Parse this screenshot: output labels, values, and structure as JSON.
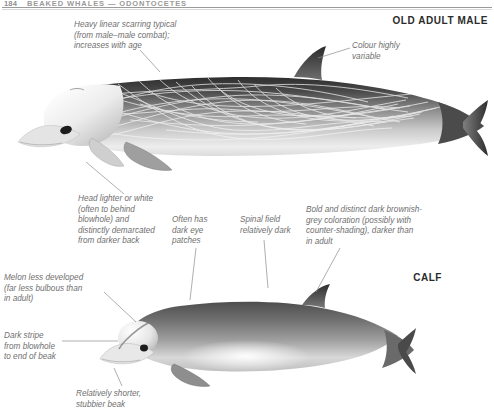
{
  "page": {
    "folio": "184",
    "running_head": "BEAKED WHALES — ODONTOCETES"
  },
  "sections": {
    "old_adult_male": "OLD ADULT MALE",
    "calf": "CALF"
  },
  "annotations": {
    "scarring": "Heavy linear scarring typical\n(from male–male combat);\nincreases with age",
    "colour_variable": "Colour highly\nvariable",
    "head_lighter": "Head lighter or white\n(often to behind\nblowhole) and\ndistinctly demarcated\nfrom darker back",
    "eye_patches": "Often has\ndark eye\npatches",
    "spinal_field": "Spinal field\nrelatively dark",
    "calf_coloration": "Bold and distinct dark brownish-\ngrey coloration (possibly with\ncounter-shading), darker than\nin adult",
    "melon": "Melon less developed\n(far less bulbous than\nin adult)",
    "dark_stripe": "Dark stripe\nfrom blowhole\nto end of beak",
    "stubbier_beak": "Relatively shorter,\nstubbier beak"
  },
  "illustrations": {
    "adult_male": "old-adult-male-beaked-whale-illustration",
    "calf": "calf-beaked-whale-illustration"
  },
  "colors": {
    "text": "#6f6f6f",
    "heading": "#2b2b2b",
    "leader_line": "#8c8c8c",
    "rule": "#9b9b9b",
    "body_dark": "#3a3a3a",
    "body_light": "#f2f2f2"
  }
}
